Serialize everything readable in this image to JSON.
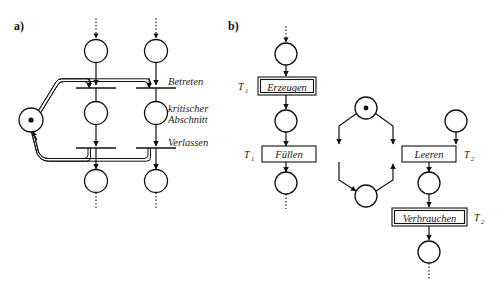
{
  "figure": {
    "background_color": "#ffffff",
    "stroke_color": "#111111",
    "token_color": "#111111"
  },
  "panel_a": {
    "key": "a)",
    "description": "Mutual exclusion Petri net with two processes and one shared mutex place",
    "labels": {
      "enter": "Betreten",
      "critical_line1": "kritischer",
      "critical_line2": "Abschnitt",
      "leave": "Verlassen"
    },
    "mutex_place": {
      "name": "mutex",
      "tokens": 1
    },
    "processes": [
      {
        "name": "process-left",
        "places": [
          "noncritical-entry",
          "critical-section",
          "noncritical-exit"
        ],
        "transitions": [
          "enter",
          "leave"
        ]
      },
      {
        "name": "process-right",
        "places": [
          "noncritical-entry",
          "critical-section",
          "noncritical-exit"
        ],
        "transitions": [
          "enter",
          "leave"
        ]
      }
    ]
  },
  "panel_b": {
    "key": "b)",
    "description": "Producer-consumer Petri net with bounded buffer",
    "transitions": [
      {
        "id": "erzeugen",
        "label": "Erzeugen",
        "tag": "T",
        "sub": "1",
        "style": "double"
      },
      {
        "id": "fuellen",
        "label": "Füllen",
        "tag": "T",
        "sub": "1",
        "style": "single"
      },
      {
        "id": "leeren",
        "label": "Leeren",
        "tag": "T",
        "sub": "2",
        "style": "single"
      },
      {
        "id": "verbrauchen",
        "label": "Verbrauchen",
        "tag": "T",
        "sub": "2",
        "style": "double"
      }
    ],
    "places": [
      {
        "id": "producer-ready",
        "tokens": 0
      },
      {
        "id": "producer-item",
        "tokens": 0
      },
      {
        "id": "buffer-free",
        "tokens": 1
      },
      {
        "id": "buffer-full",
        "tokens": 0
      },
      {
        "id": "producer-done",
        "tokens": 0
      },
      {
        "id": "consumer-item",
        "tokens": 0
      },
      {
        "id": "consumer-done",
        "tokens": 0
      },
      {
        "id": "consumer-ready",
        "tokens": 0
      }
    ]
  }
}
